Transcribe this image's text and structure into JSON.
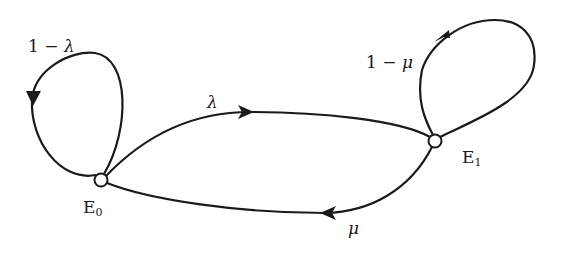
{
  "diagram": {
    "type": "state-transition",
    "nodes": [
      {
        "id": "E0",
        "label": "E",
        "subscript": "0"
      },
      {
        "id": "E1",
        "label": "E",
        "subscript": "1"
      }
    ],
    "edges": [
      {
        "from": "E0",
        "to": "E0",
        "label_prefix": "1 − ",
        "label_symbol": "λ"
      },
      {
        "from": "E0",
        "to": "E1",
        "label_symbol": "λ"
      },
      {
        "from": "E1",
        "to": "E0",
        "label_symbol": "μ"
      },
      {
        "from": "E1",
        "to": "E1",
        "label_prefix": "1 − ",
        "label_symbol": "μ"
      }
    ],
    "colors": {
      "stroke": "#1a1a1a",
      "background": "#ffffff"
    }
  }
}
